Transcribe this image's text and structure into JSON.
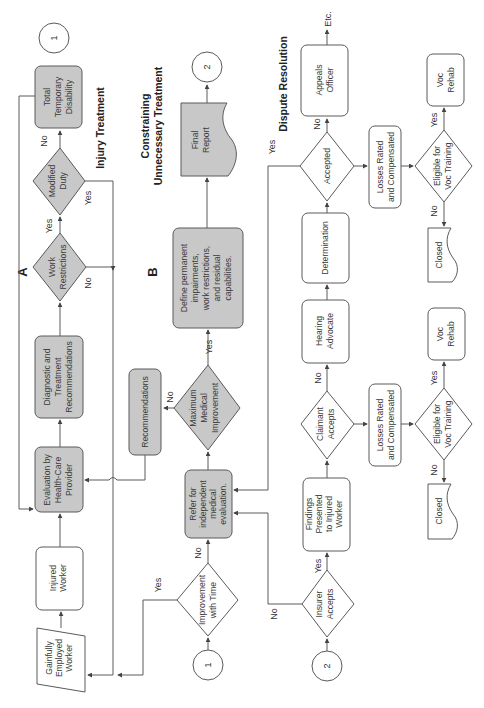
{
  "figure": {
    "orientation": "rotated-90-ccw",
    "sections": {
      "injury_treatment": "Injury Treatment",
      "constraining": "Constraining",
      "unnecessary_treatment": "Unnecessary Treatment",
      "dispute_resolution": "Dispute Resolution"
    },
    "markers": {
      "a": "A",
      "b": "B"
    },
    "connectors": {
      "c1": "1",
      "c2": "2"
    },
    "nodes": {
      "gainfully_employed": [
        "Gainfully",
        "Employed",
        "Worker"
      ],
      "injured_worker": [
        "Injured",
        "Worker"
      ],
      "evaluation": [
        "Evaluation by",
        "Health-Care",
        "Provider"
      ],
      "diagnostic": [
        "Diagnostic and",
        "Treatment",
        "Recommendations"
      ],
      "work_restrictions": [
        "Work",
        "Restrictions"
      ],
      "modified_duty": [
        "Modified",
        "Duty"
      ],
      "total_temporary": [
        "Total",
        "Temporary",
        "Disability"
      ],
      "improvement": [
        "Improvement",
        "with Time"
      ],
      "refer_ime": [
        "Refer for",
        "independent",
        "medical",
        "evaluation."
      ],
      "recommendations": [
        "Recommendations"
      ],
      "mmi": [
        "Maximum",
        "Medical",
        "Improvement"
      ],
      "define_permanent": [
        "Define permanent",
        "impairments,",
        "work restrictions,",
        "and residual",
        "capabilities."
      ],
      "final_report": [
        "Final",
        "Report"
      ],
      "insurer_accepts": [
        "Insurer",
        "Accepts"
      ],
      "findings": [
        "Findings",
        "Presented",
        "to Injured",
        "Worker"
      ],
      "claimant_accepts": [
        "Claimant",
        "Accepts"
      ],
      "hearing_advocate": [
        "Hearing",
        "Advocate"
      ],
      "determination": [
        "Determination"
      ],
      "accepted": [
        "Accepted"
      ],
      "appeals_officer": [
        "Appeals",
        "Officer"
      ],
      "losses_1": [
        "Losses Rated",
        "and Compensated"
      ],
      "eligible_1": [
        "Eligible for",
        "Voc Training"
      ],
      "voc_rehab_1": [
        "Voc",
        "Rehab"
      ],
      "closed_1": [
        "Closed"
      ],
      "losses_2": [
        "Losses Rated",
        "and Compensated"
      ],
      "eligible_2": [
        "Eligible for",
        "Voc Training"
      ],
      "voc_rehab_2": [
        "Voc",
        "Rehab"
      ],
      "closed_2": [
        "Closed"
      ]
    },
    "edge_labels": {
      "yes": "Yes",
      "no": "No",
      "etc": "Etc."
    }
  }
}
